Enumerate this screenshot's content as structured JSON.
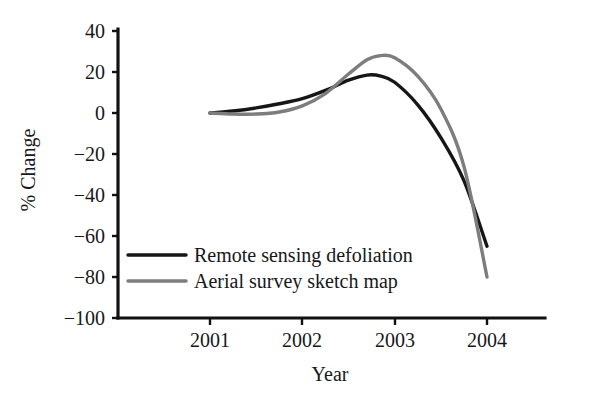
{
  "chart_data": {
    "type": "line",
    "title": "",
    "subtitle": "",
    "xlabel": "Year",
    "ylabel": "% Change",
    "x": [
      2001,
      2002,
      2003,
      2004
    ],
    "xtick_labels": [
      "2001",
      "2002",
      "2003",
      "2004"
    ],
    "ytick_labels": [
      "40",
      "20",
      "0",
      "−20",
      "−40",
      "−60",
      "−80",
      "−100"
    ],
    "ytick_values": [
      40,
      20,
      0,
      -20,
      -40,
      -60,
      -80,
      -100
    ],
    "xlim": [
      2001,
      2004.6
    ],
    "ylim": [
      -100,
      40
    ],
    "grid": false,
    "legend_position": "lower-left-inside",
    "series": [
      {
        "name": "Remote sensing defoliation",
        "color": "#161616",
        "linewidth": 3.4,
        "x": [
          2001.0,
          2001.25,
          2001.5,
          2001.75,
          2002.0,
          2002.25,
          2002.5,
          2002.7,
          2002.85,
          2003.0,
          2003.25,
          2003.5,
          2003.75,
          2004.0
        ],
        "values": [
          0,
          1,
          2.5,
          4.5,
          7,
          11,
          16,
          18.5,
          18,
          15,
          4,
          -12,
          -33,
          -65
        ]
      },
      {
        "name": "Aerial survey sketch map",
        "color": "#7d7d7d",
        "linewidth": 3.4,
        "x": [
          2001.0,
          2001.25,
          2001.5,
          2001.75,
          2002.0,
          2002.25,
          2002.5,
          2002.7,
          2002.85,
          2003.0,
          2003.25,
          2003.5,
          2003.75,
          2004.0
        ],
        "values": [
          0,
          -0.5,
          -0.5,
          0.5,
          3.5,
          9.5,
          19,
          26,
          28,
          27,
          18,
          2,
          -26,
          -80
        ]
      }
    ],
    "annotations": []
  },
  "legend": {
    "entries": [
      {
        "label": "Remote sensing defoliation",
        "color": "#161616"
      },
      {
        "label": "Aerial survey sketch map",
        "color": "#7d7d7d"
      }
    ]
  },
  "axes": {
    "y_title": "% Change",
    "x_title": "Year",
    "y_ticks": [
      "40",
      "20",
      "0",
      "−20",
      "−40",
      "−60",
      "−80",
      "−100"
    ],
    "x_ticks": [
      "2001",
      "2002",
      "2003",
      "2004"
    ]
  }
}
